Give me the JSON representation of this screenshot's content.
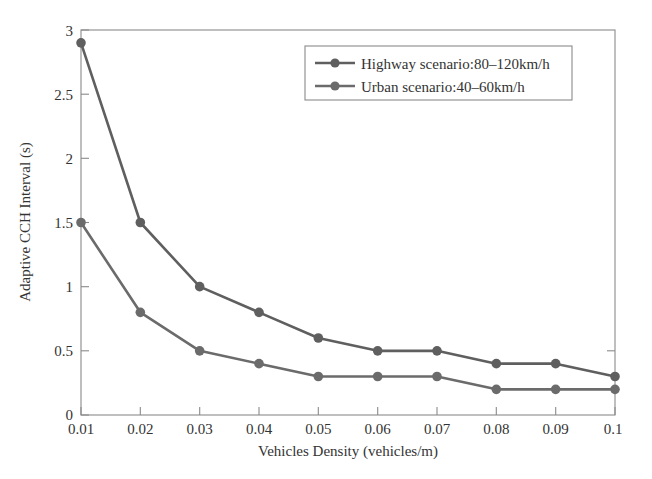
{
  "chart_data": {
    "type": "line",
    "title": "",
    "xlabel": "Vehicles Density (vehicles/m)",
    "ylabel": "Adaptive CCH Interval (s)",
    "x": [
      0.01,
      0.02,
      0.03,
      0.04,
      0.05,
      0.06,
      0.07,
      0.08,
      0.09,
      0.1
    ],
    "xtick_labels": [
      "0.01",
      "0.02",
      "0.03",
      "0.04",
      "0.05",
      "0.06",
      "0.07",
      "0.08",
      "0.09",
      "0.1"
    ],
    "ytick_labels": [
      "0",
      "0.5",
      "1",
      "1.5",
      "2",
      "2.5",
      "3"
    ],
    "ytick_values": [
      0,
      0.5,
      1,
      1.5,
      2,
      2.5,
      3
    ],
    "xlim": [
      0.01,
      0.1
    ],
    "ylim": [
      0,
      3
    ],
    "grid": false,
    "legend_position": "top-right",
    "series": [
      {
        "name": "Highway scenario:80–120km/h",
        "color": "#5f5f5f",
        "marker": "circle",
        "values": [
          2.9,
          1.5,
          1.0,
          0.8,
          0.6,
          0.5,
          0.5,
          0.4,
          0.4,
          0.3
        ]
      },
      {
        "name": "Urban scenario:40–60km/h",
        "color": "#6b6b6b",
        "marker": "circle",
        "values": [
          1.5,
          0.8,
          0.5,
          0.4,
          0.3,
          0.3,
          0.3,
          0.2,
          0.2,
          0.2
        ]
      }
    ]
  },
  "figure": {
    "background_color": "#ffffff",
    "axis_color": "#8a8a8a",
    "text_color": "#333333"
  }
}
